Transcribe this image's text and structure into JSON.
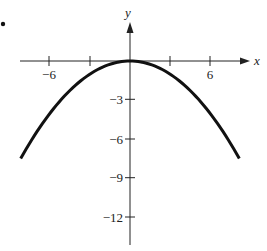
{
  "chart_data": {
    "type": "line",
    "title": "",
    "xlabel": "x",
    "ylabel": "y",
    "function": "y = -x^2/9",
    "x_ticks": [
      -6,
      -3,
      3,
      6
    ],
    "x_tick_labels": [
      "−6",
      "6"
    ],
    "y_ticks": [
      -3,
      -6,
      -9,
      -12
    ],
    "y_tick_labels": [
      "−3",
      "−6",
      "−9",
      "−12"
    ],
    "xlim": [
      -9.5,
      9.5
    ],
    "ylim": [
      -14,
      3
    ],
    "grid": false,
    "series": [
      {
        "name": "parabola",
        "x": [
          -8.2,
          -7,
          -6,
          -5,
          -4,
          -3,
          -2,
          -1,
          0,
          1,
          2,
          3,
          4,
          5,
          6,
          7,
          8.2
        ],
        "y": [
          -7.47,
          -5.44,
          -4,
          -2.78,
          -1.78,
          -1,
          -0.44,
          -0.11,
          0,
          -0.11,
          -0.44,
          -1,
          -1.78,
          -2.78,
          -4,
          -5.44,
          -7.47
        ]
      }
    ]
  },
  "labels": {
    "x_axis": "x",
    "y_axis": "y",
    "xt_neg6": "−6",
    "xt_6": "6",
    "yt_neg3": "−3",
    "yt_neg6": "−6",
    "yt_neg9": "−9",
    "yt_neg12": "−12"
  }
}
